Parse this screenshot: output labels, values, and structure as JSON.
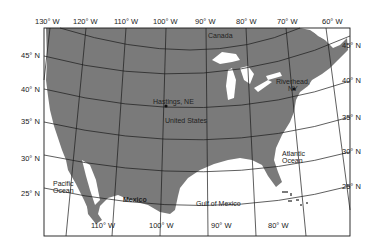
{
  "map": {
    "colors": {
      "land": "#7a7a7a",
      "water": "#ffffff",
      "grid": "#1a1a1a",
      "frame": "#1a1a1a",
      "text": "#222222"
    },
    "top_longitude_labels": [
      "130° W",
      "120° W",
      "110° W",
      "100° W",
      "90° W",
      "80° W",
      "70° W",
      "60° W"
    ],
    "bottom_longitude_labels": [
      "110° W",
      "100° W",
      "90° W",
      "80° W"
    ],
    "left_latitude_labels": [
      "45° N",
      "40° N",
      "35° N",
      "30° N",
      "25° N"
    ],
    "right_latitude_labels": [
      "45° N",
      "40° N",
      "35° N",
      "30° N",
      "25° N"
    ],
    "places": {
      "canada": "Canada",
      "hastings": "Hastings, NE",
      "riverhead_line1": "Riverhead,",
      "riverhead_line2": "NY",
      "united_states": "United States",
      "atlantic_line1": "Atlantic",
      "atlantic_line2": "Ocean",
      "pacific_line1": "Pacific",
      "pacific_line2": "Ocean",
      "mexico": "Mexico",
      "gulf": "Gulf of Mexico"
    }
  }
}
